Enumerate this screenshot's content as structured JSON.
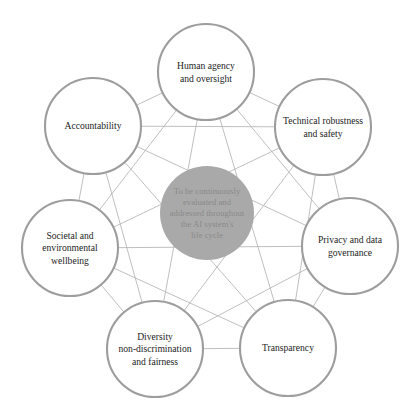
{
  "diagram": {
    "layout": "heptagon",
    "edges": "complete-graph",
    "colors": {
      "background": "#ffffff",
      "node_stroke": "#9d9d9d",
      "node_fill": "#ffffff",
      "edge_stroke": "#b4b4b4",
      "hub_fill": "#a9a9a9",
      "node_text": "#1d1d1d",
      "hub_text": "#8a8a8a"
    },
    "hub": {
      "name": "center-hub",
      "lines": [
        "To be continuously",
        "evaluated and",
        "addressed throughout",
        "the AI system's",
        "life cycle"
      ]
    },
    "nodes": [
      {
        "id": "human-agency-and-oversight",
        "lines": [
          "Human agency",
          "and oversight"
        ],
        "cx": 206,
        "cy": 72
      },
      {
        "id": "technical-robustness-and-safety",
        "lines": [
          "Technical robustness",
          "and safety"
        ],
        "cx": 323,
        "cy": 127
      },
      {
        "id": "privacy-and-data-governance",
        "lines": [
          "Privacy and data",
          "governance"
        ],
        "cx": 350,
        "cy": 246
      },
      {
        "id": "transparency",
        "lines": [
          "Transparency"
        ],
        "cx": 288,
        "cy": 348
      },
      {
        "id": "diversity-non-discrimination-and-fairness",
        "lines": [
          "Diversity",
          "non-discrimination",
          "and fairness"
        ],
        "cx": 155,
        "cy": 349
      },
      {
        "id": "societal-and-environmental-wellbeing",
        "lines": [
          "Societal and",
          "environmental",
          "wellbeing"
        ],
        "cx": 70,
        "cy": 248
      },
      {
        "id": "accountability",
        "lines": [
          "Accountability"
        ],
        "cx": 93,
        "cy": 126
      }
    ]
  }
}
